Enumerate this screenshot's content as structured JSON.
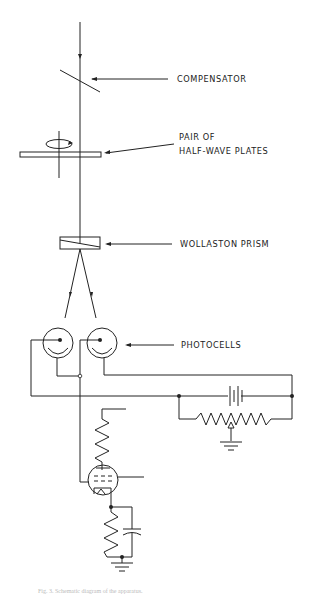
{
  "diagram": {
    "type": "optical-electronic schematic",
    "labels": {
      "compensator": "COMPENSATOR",
      "half_wave_1": "PAIR OF",
      "half_wave_2": "HALF-WAVE PLATES",
      "wollaston": "WOLLASTON PRISM",
      "photocells": "PHOTOCELLS"
    },
    "caption": "Fig. 3.   Schematic diagram of the apparatus.",
    "components": [
      "light-beam",
      "compensator",
      "half-wave-plates",
      "wollaston-prism",
      "photocell-left",
      "photocell-right",
      "battery",
      "potentiometer",
      "vacuum-tube",
      "plate-resistor",
      "cathode-resistor",
      "bypass-capacitor",
      "ground"
    ]
  }
}
